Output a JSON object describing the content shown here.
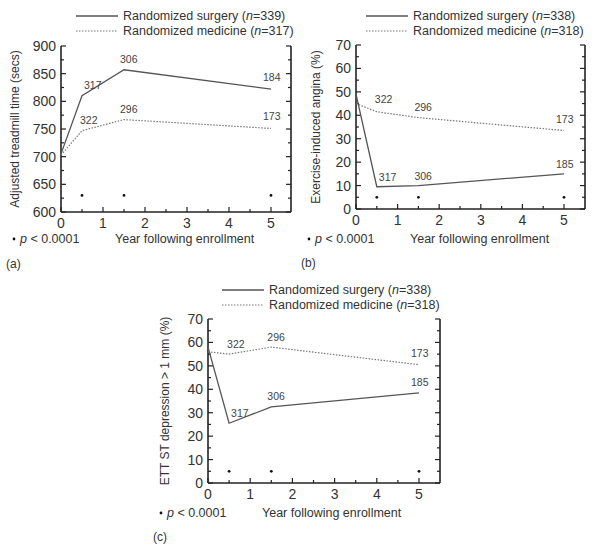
{
  "chart_data": [
    {
      "type": "line",
      "panel": "(a)",
      "title": "",
      "xlabel": "Year following enrollment",
      "ylabel": "Adjusted treadmill time (secs)",
      "xlim": [
        0,
        5.5
      ],
      "ylim": [
        600,
        900
      ],
      "xticks": [
        0,
        1,
        2,
        3,
        4,
        5
      ],
      "yticks": [
        600,
        650,
        700,
        750,
        800,
        850,
        900
      ],
      "grid": false,
      "legend_position": "top",
      "footnote": "p < 0.0001",
      "footnote_marker": "•",
      "series": [
        {
          "name": "Randomized surgery",
          "n": "339",
          "style": "solid",
          "x": [
            0,
            0.5,
            1.5,
            5
          ],
          "y": [
            705,
            810,
            857,
            822
          ],
          "point_labels": [
            "",
            "317",
            "306",
            "184"
          ]
        },
        {
          "name": "Randomized medicine",
          "n": "317",
          "style": "dotted",
          "x": [
            0,
            0.5,
            1.5,
            5
          ],
          "y": [
            703,
            747,
            767,
            751
          ],
          "point_labels": [
            "",
            "322",
            "296",
            "173"
          ]
        }
      ],
      "significance_markers": {
        "x": [
          0.5,
          1.5,
          5
        ],
        "y": 630
      }
    },
    {
      "type": "line",
      "panel": "(b)",
      "title": "",
      "xlabel": "Year following enrollment",
      "ylabel": "Exercise-induced angina (%)",
      "xlim": [
        0,
        5.5
      ],
      "ylim": [
        0,
        70
      ],
      "xticks": [
        0,
        1,
        2,
        3,
        4,
        5
      ],
      "yticks": [
        0,
        10,
        20,
        30,
        40,
        50,
        60,
        70
      ],
      "grid": false,
      "legend_position": "top",
      "footnote": "p < 0.0001",
      "footnote_marker": "•",
      "series": [
        {
          "name": "Randomized surgery",
          "n": "338",
          "style": "solid",
          "x": [
            0,
            0.5,
            1.5,
            5
          ],
          "y": [
            49,
            9.5,
            10,
            15
          ],
          "point_labels": [
            "",
            "317",
            "306",
            "185"
          ]
        },
        {
          "name": "Randomized medicine",
          "n": "318",
          "style": "dotted",
          "x": [
            0,
            0.5,
            1.5,
            5
          ],
          "y": [
            45,
            41.5,
            39,
            33.5
          ],
          "point_labels": [
            "",
            "322",
            "296",
            "173"
          ]
        }
      ],
      "significance_markers": {
        "x": [
          0.5,
          1.5,
          5
        ],
        "y": 5
      }
    },
    {
      "type": "line",
      "panel": "(c)",
      "title": "",
      "xlabel": "Year following enrollment",
      "ylabel": "ETT ST depression > 1 mm (%)",
      "xlim": [
        0,
        5.5
      ],
      "ylim": [
        0,
        70
      ],
      "xticks": [
        0,
        1,
        2,
        3,
        4,
        5
      ],
      "yticks": [
        0,
        10,
        20,
        30,
        40,
        50,
        60,
        70
      ],
      "grid": false,
      "legend_position": "top",
      "footnote": "p < 0.0001",
      "footnote_marker": "•",
      "series": [
        {
          "name": "Randomized surgery",
          "n": "338",
          "style": "solid",
          "x": [
            0,
            0.5,
            1.5,
            5
          ],
          "y": [
            58,
            25.5,
            32.5,
            38.5
          ],
          "point_labels": [
            "",
            "317",
            "306",
            "185"
          ]
        },
        {
          "name": "Randomized medicine",
          "n": "318",
          "style": "dotted",
          "x": [
            0,
            0.5,
            1.5,
            5
          ],
          "y": [
            56,
            55,
            58,
            50.5
          ],
          "point_labels": [
            "",
            "322",
            "296",
            "173"
          ]
        }
      ],
      "significance_markers": {
        "x": [
          0.5,
          1.5,
          5
        ],
        "y": 5
      }
    }
  ]
}
